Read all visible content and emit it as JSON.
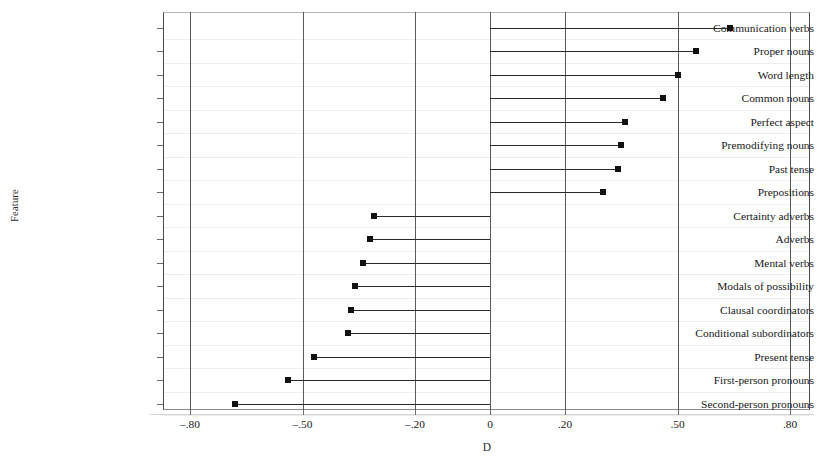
{
  "chart_data": {
    "type": "bar",
    "orientation": "horizontal",
    "style": "lollipop",
    "title": "",
    "xlabel": "D",
    "ylabel": "Feature",
    "xlim": [
      -0.88,
      0.855
    ],
    "xticks": [
      -0.8,
      -0.5,
      -0.2,
      0,
      0.2,
      0.5,
      0.8
    ],
    "xtick_labels": [
      "–.80",
      "–.50",
      "–.20",
      "0",
      ".20",
      ".50",
      ".80"
    ],
    "grid": "vertical",
    "legend": "none",
    "baseline": 0,
    "categories": [
      "Communication verbs",
      "Proper nouns",
      "Word length",
      "Common nouns",
      "Perfect aspect",
      "Premodifying nouns",
      "Past tense",
      "Prepositions",
      "Certainty adverbs",
      "Adverbs",
      "Mental verbs",
      "Modals of possibility",
      "Clausal coordinators",
      "Conditional subordinators",
      "Present tense",
      "First-person pronouns",
      "Second-person pronouns"
    ],
    "values": [
      0.64,
      0.55,
      0.5,
      0.46,
      0.36,
      0.35,
      0.34,
      0.3,
      -0.31,
      -0.32,
      -0.34,
      -0.36,
      -0.37,
      -0.38,
      -0.47,
      -0.54,
      -0.68
    ]
  },
  "colors": {
    "marker": "#111111",
    "stem": "#2a2a2a",
    "gridline": "#5a5a5a",
    "frame": "#4a4a4a",
    "background": "#ffffff"
  }
}
